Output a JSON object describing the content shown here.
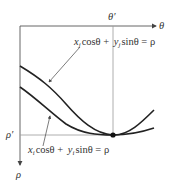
{
  "diagram": {
    "type": "hough-parameter-space",
    "axes": {
      "horizontal_label": "θ",
      "vertical_label": "ρ",
      "theta_prime_label": "θ′",
      "rho_prime_label": "ρ′"
    },
    "curves": [
      {
        "name": "curve-j",
        "equation": {
          "x": "x",
          "x_sub": "j",
          "cos": "cosθ + ",
          "y": "y",
          "y_sub": "j",
          "sin": "sinθ = ρ"
        }
      },
      {
        "name": "curve-i",
        "equation": {
          "x": "x",
          "x_sub": "i",
          "cos": "cosθ + ",
          "y": "y",
          "y_sub": "i",
          "sin": "sinθ = ρ"
        }
      }
    ],
    "intersection": {
      "label": "(θ′, ρ′)"
    },
    "colors": {
      "axis": "#555555",
      "guide": "#999999",
      "curve": "#222222",
      "text": "#333333"
    }
  }
}
